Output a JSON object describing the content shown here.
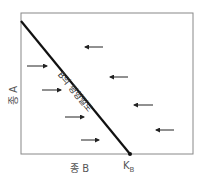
{
  "diagram": {
    "title": "",
    "y_axis_label": "종 A",
    "x_axis_label": "종 B",
    "x_intercept_label": "K",
    "x_intercept_subscript": "B",
    "isocline_label": "B의 평형밀도",
    "colors": {
      "frame": "#888888",
      "isocline": "#111111",
      "arrows": "#222222"
    },
    "isocline": {
      "from": [
        21,
        21
      ],
      "to": [
        130,
        154
      ]
    },
    "arrows_right": [
      {
        "x1": 27,
        "x2": 47,
        "y": 66
      },
      {
        "x1": 42,
        "x2": 61,
        "y": 90
      },
      {
        "x1": 65,
        "x2": 84,
        "y": 117
      },
      {
        "x1": 81,
        "x2": 99,
        "y": 140
      }
    ],
    "arrows_left": [
      {
        "x1": 103,
        "x2": 85,
        "y": 47
      },
      {
        "x1": 128,
        "x2": 110,
        "y": 77
      },
      {
        "x1": 153,
        "x2": 134,
        "y": 105
      },
      {
        "x1": 174,
        "x2": 156,
        "y": 130
      }
    ]
  }
}
